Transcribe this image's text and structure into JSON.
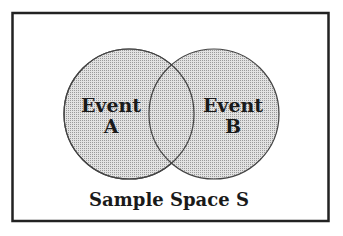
{
  "diagram": {
    "type": "venn",
    "caption": "Sample Space S",
    "sets": [
      {
        "label_line1": "Event",
        "label_line2": "A"
      },
      {
        "label_line1": "Event",
        "label_line2": "B"
      }
    ],
    "colors": {
      "fill": "#cfcfcf",
      "stroke": "#444444",
      "border": "#222222",
      "background": "#ffffff"
    }
  }
}
